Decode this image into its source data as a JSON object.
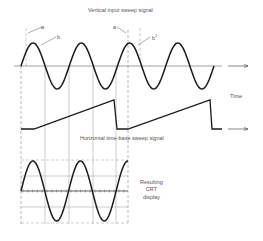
{
  "labels": {
    "top_title": "Vertical input sweep signal",
    "mid_title": "Horizontal time-base sweep signal",
    "time_axis": "Time",
    "crt_line1": "Resulting",
    "crt_line2": "CRT",
    "crt_line3": "display",
    "marker_a_left": "a",
    "marker_b_left": "b",
    "marker_a_right": "a",
    "marker_b_right": "b",
    "marker_b_right_sup": "1"
  },
  "colors": {
    "stroke": "#1a1a1a",
    "grid": "#8a8a8a",
    "text": "#555555",
    "background": "#ffffff"
  },
  "vertical_signal": {
    "type": "sine",
    "cycles": 4,
    "x_start": 21,
    "x_end": 214,
    "axis_y": 66,
    "amplitude": 23,
    "axis_x_start": 14,
    "axis_x_end": 222,
    "arrow_x_start": 228,
    "arrow_x_end": 248
  },
  "horizontal_signal": {
    "type": "sawtooth",
    "baseline_y": 129,
    "peak_y": 100,
    "points": [
      [
        21,
        129
      ],
      [
        34,
        129
      ],
      [
        114,
        100
      ],
      [
        117,
        129
      ],
      [
        128,
        129
      ],
      [
        210,
        100
      ],
      [
        212,
        129
      ],
      [
        222,
        129
      ]
    ],
    "arrow_x_start": 228,
    "arrow_x_end": 248
  },
  "crt_display": {
    "x_left": 21,
    "x_right": 128,
    "y_top": 160,
    "y_bottom": 224,
    "center_y": 191,
    "grid_h_lines": [
      160,
      176,
      191,
      207,
      223
    ],
    "grid_v_lines": [
      45,
      69,
      93,
      116
    ],
    "sine_cycles_visible": 2.25,
    "amplitude": 30
  },
  "guide_lines": {
    "dashed": [
      21,
      128
    ],
    "solid": [
      45,
      69,
      93,
      116
    ],
    "marker_dashed_top": [
      26,
      140
    ]
  }
}
